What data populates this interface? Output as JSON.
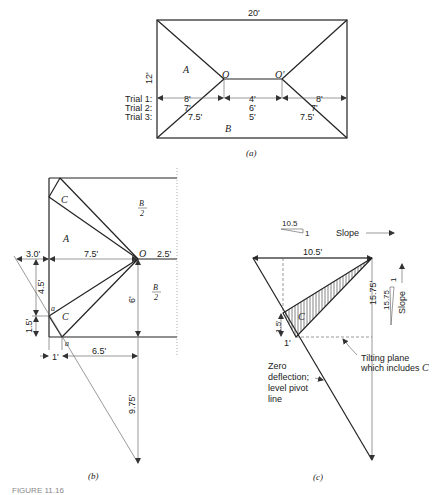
{
  "panel_a": {
    "width_label": "20'",
    "height_label": "12'",
    "region_A": "A",
    "region_B": "B",
    "point_O_left": "O",
    "point_O_right": "O'",
    "trials": [
      {
        "label": "Trial 1:",
        "left": "8'",
        "mid": "4'",
        "right": "8'"
      },
      {
        "label": "Trial 2:",
        "left": "7'",
        "mid": "6'",
        "right": "7'"
      },
      {
        "label": "Trial 3:",
        "left": "7.5'",
        "mid": "5'",
        "right": "7.5'"
      }
    ],
    "caption": "(a)"
  },
  "panel_b": {
    "region_A": "A",
    "region_C_top": "C",
    "region_C_bottom": "C",
    "half_B_top_num": "B",
    "half_B_top_den": "2",
    "half_B_bottom_num": "B",
    "half_B_bottom_den": "2",
    "point_O": "O",
    "point_a1": "a",
    "point_a2": "a",
    "dim_3": "3.0'",
    "dim_7_5": "7.5'",
    "dim_2_5": "2.5'",
    "dim_4_5": "4.5'",
    "dim_1_5": "1.5'",
    "dim_6": "6'",
    "dim_1": "1'",
    "dim_6_5": "6.5'",
    "dim_9_75": "9.75'",
    "caption": "(b)"
  },
  "panel_c": {
    "slope_h_run": "10.5",
    "slope_h_rise": "1",
    "slope_h_label": "Slope",
    "dim_10_5": "10.5'",
    "dim_15_75": "15.75'",
    "slope_v_run": "15.75",
    "slope_v_rise": "1",
    "slope_v_label": "Slope",
    "dim_1_5": "1.5'",
    "dim_1": "1'",
    "region_C": "C",
    "tilt_label_1": "Tilting plane",
    "tilt_label_2": "which includes",
    "tilt_label_C": "C",
    "zero_label_1": "Zero",
    "zero_label_2": "deflection;",
    "zero_label_3": "level pivot",
    "zero_label_4": "line",
    "caption": "(c)"
  },
  "figure_caption": "FIGURE 11.16"
}
